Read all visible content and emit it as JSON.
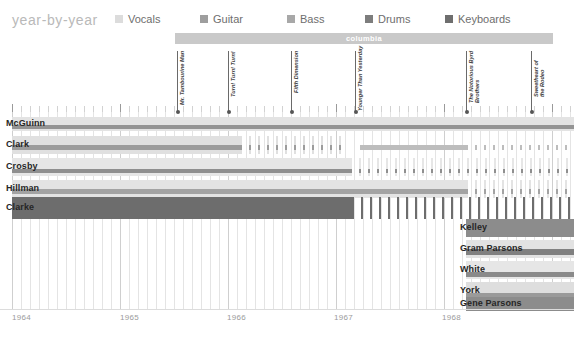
{
  "header": {
    "title": "year-by-year",
    "legend": [
      {
        "label": "Vocals",
        "color": "#dcdcdc",
        "x": 0
      },
      {
        "label": "Guitar",
        "color": "#9e9e9e",
        "x": 85
      },
      {
        "label": "Bass",
        "color": "#a8a8a8",
        "x": 172
      },
      {
        "label": "Drums",
        "color": "#7d7d7d",
        "x": 250
      },
      {
        "label": "Keyboards",
        "color": "#6e6e6e",
        "x": 330
      }
    ]
  },
  "chart_data": {
    "type": "timeline",
    "title": "year-by-year",
    "xlabel": "",
    "ylabel": "",
    "xlim": [
      "1964-01",
      "1968-09"
    ],
    "grid": true,
    "legend_position": "top",
    "axis": {
      "years": [
        "1964",
        "1965",
        "1966",
        "1967",
        "1968"
      ],
      "year_x": [
        12,
        120,
        227,
        334,
        442
      ],
      "tick_spacing_months": 9.0
    },
    "eras": [
      {
        "label": "columbia",
        "x": 175,
        "width": 378,
        "color": "#c9c9c9"
      }
    ],
    "albums": [
      {
        "label": "Mr. Tambourine Man",
        "x": 177,
        "label_top": 51,
        "label_len": 54
      },
      {
        "label": "Turn! Turn! Turn!",
        "x": 228,
        "label_top": 51,
        "label_len": 46
      },
      {
        "label": "Fifth Dimension",
        "x": 291,
        "label_top": 51,
        "label_len": 42
      },
      {
        "label": "Younger Than Yesterday",
        "x": 355,
        "label_top": 51,
        "label_len": 60
      },
      {
        "label": "The Notorious Byrd\nBrothers",
        "x": 466,
        "label_top": 51,
        "label_len": 52
      },
      {
        "label": "Sweetheart of\nthe Rodeo",
        "x": 531,
        "label_top": 51,
        "label_len": 46
      }
    ],
    "members": [
      {
        "name": "McGuinn",
        "top": 117,
        "height": 14,
        "band": {
          "color": "#e3e3e3",
          "x": 12,
          "solid_to": 574,
          "fade_to": 574
        },
        "stripes": [
          {
            "role": "Guitar",
            "color": "#949494",
            "x": 12,
            "top": 8,
            "h": 4,
            "solid_to": 574,
            "fade_to": 574
          }
        ]
      },
      {
        "name": "Clark",
        "top": 136,
        "height": 18,
        "band": {
          "color": "#e0e0e0",
          "x": 12,
          "solid_to": 240,
          "fade_to": 348
        },
        "stripes": [
          {
            "role": "Guitar",
            "color": "#9c9c9c",
            "x": 12,
            "top": 9,
            "h": 5,
            "solid_to": 240,
            "fade_to": 348
          },
          {
            "role": "Guitar2",
            "color": "#bdbdbd",
            "x": 360,
            "top": 9,
            "h": 5,
            "solid_to": 466,
            "fade_to": 574
          }
        ]
      },
      {
        "name": "Crosby",
        "top": 158,
        "height": 18,
        "band": {
          "color": "#e6e6e6",
          "x": 12,
          "solid_to": 350,
          "fade_to": 574
        },
        "stripes": [
          {
            "role": "Guitar",
            "color": "#8f8f8f",
            "x": 12,
            "top": 11,
            "h": 4,
            "solid_to": 350,
            "fade_to": 574
          }
        ]
      },
      {
        "name": "Hillman",
        "top": 180,
        "height": 18,
        "band": {
          "color": "#e3e3e3",
          "x": 12,
          "solid_to": 466,
          "fade_to": 574
        },
        "stripes": [
          {
            "role": "Bass",
            "color": "#a3a3a3",
            "x": 12,
            "top": 9,
            "h": 5,
            "solid_to": 466,
            "fade_to": 574
          }
        ]
      },
      {
        "name": "Clarke",
        "top": 197,
        "height": 22,
        "band": {
          "color": "#6d6d6d",
          "x": 12,
          "solid_to": 352,
          "fade_to": 574
        },
        "stripes": []
      },
      {
        "name": "Kelley",
        "top": 219,
        "height": 18,
        "band": {
          "color": "#8c8c8c",
          "x": 466,
          "solid_to": 574,
          "fade_to": 574
        },
        "stripes": []
      },
      {
        "name": "Gram Parsons",
        "top": 240,
        "height": 18,
        "band": {
          "color": "#e2e2e2",
          "x": 466,
          "solid_to": 574,
          "fade_to": 574
        },
        "stripes": [
          {
            "role": "Keyboards",
            "color": "#808080",
            "x": 466,
            "top": 9,
            "h": 6,
            "solid_to": 574,
            "fade_to": 574
          }
        ]
      },
      {
        "name": "White",
        "top": 261,
        "height": 18,
        "band": {
          "color": "#e6e6e6",
          "x": 466,
          "solid_to": 574,
          "fade_to": 574
        },
        "stripes": [
          {
            "role": "Guitar",
            "color": "#8a8a8a",
            "x": 466,
            "top": 11,
            "h": 5,
            "solid_to": 574,
            "fade_to": 574
          }
        ]
      },
      {
        "name": "York",
        "top": 282,
        "height": 18,
        "band": {
          "color": "#dedede",
          "x": 466,
          "solid_to": 574,
          "fade_to": 574
        },
        "stripes": [
          {
            "role": "Bass",
            "color": "#9a9a9a",
            "x": 466,
            "top": 11,
            "h": 5,
            "solid_to": 574,
            "fade_to": 574
          }
        ]
      },
      {
        "name": "Gene Parsons",
        "top": 297,
        "height": 14,
        "band": {
          "color": "#8c8c8c",
          "x": 466,
          "solid_to": 574,
          "fade_to": 574
        },
        "stripes": []
      }
    ]
  }
}
